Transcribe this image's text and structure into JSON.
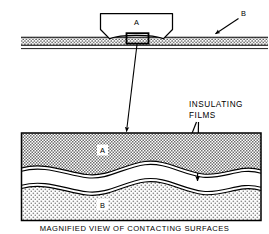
{
  "figure": {
    "caption": "MAGNIFIED VIEW OF CONTACTING SURFACES",
    "callout_line1": "INSULATING",
    "callout_line2": "FILMS",
    "colors": {
      "ink": "#000000",
      "background": "#ffffff",
      "hatch_a": "#8a8a8a",
      "dot_b": "#9a9a9a",
      "strip_fill": "#b4b4b4"
    }
  },
  "upper_view": {
    "body_a_label": "A",
    "surface_b_label": "B"
  },
  "magnified_view": {
    "region_a_label": "A",
    "region_b_label": "B"
  }
}
